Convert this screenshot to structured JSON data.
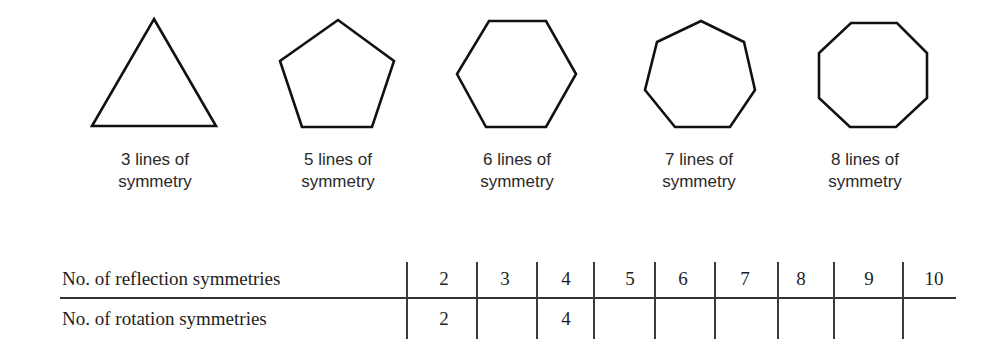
{
  "shapes": [
    {
      "name": "equilateral-triangle",
      "sides": 3,
      "caption_line1": "3 lines of",
      "caption_line2": "symmetry"
    },
    {
      "name": "regular-pentagon",
      "sides": 5,
      "caption_line1": "5 lines of",
      "caption_line2": "symmetry"
    },
    {
      "name": "regular-hexagon",
      "sides": 6,
      "caption_line1": "6 lines of",
      "caption_line2": "symmetry"
    },
    {
      "name": "regular-heptagon",
      "sides": 7,
      "caption_line1": "7 lines of",
      "caption_line2": "symmetry"
    },
    {
      "name": "regular-octagon",
      "sides": 8,
      "caption_line1": "8 lines of",
      "caption_line2": "symmetry"
    }
  ],
  "table": {
    "rows": [
      {
        "label": "No. of reflection symmetries",
        "cells": [
          "2",
          "3",
          "4",
          "5",
          "6",
          "7",
          "8",
          "9",
          "10"
        ]
      },
      {
        "label": "No. of rotation symmetries",
        "cells": [
          "2",
          "",
          "4",
          "",
          "",
          "",
          "",
          "",
          ""
        ]
      }
    ]
  },
  "colors": {
    "stroke": "#111111",
    "text": "#2a2a2a",
    "background": "#ffffff"
  }
}
